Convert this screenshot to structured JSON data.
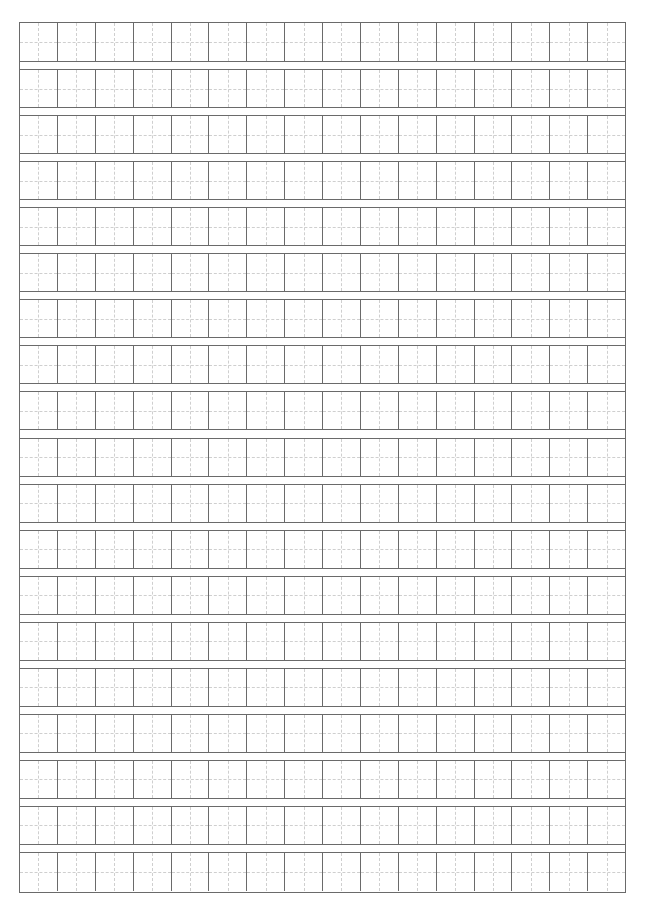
{
  "sheet": {
    "type": "tianzige-writing-grid",
    "rows": 19,
    "columns": 16,
    "line_color": "#6a6a6a",
    "guide_color": "#cfcfcf",
    "background": "#ffffff"
  }
}
